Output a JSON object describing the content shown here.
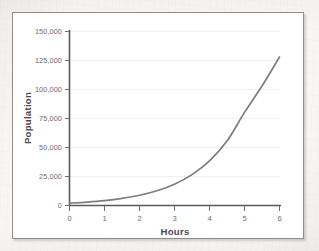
{
  "figure": {
    "background_color": "#ffffff",
    "frame_color": "#8e8e8e",
    "page_color": "#f7f6f4"
  },
  "chart_data": {
    "type": "line",
    "title": "",
    "subtitle": "",
    "xlabel": "Hours",
    "ylabel": "Population",
    "xlim": [
      0,
      6
    ],
    "ylim": [
      0,
      150000
    ],
    "grid": true,
    "grid_axis": "y",
    "legend": false,
    "legend_position": "none",
    "line_color": "#7d7d7d",
    "x_ticks": [
      0,
      1,
      2,
      3,
      4,
      5,
      6
    ],
    "x_tick_labels": [
      "0",
      "1",
      "2",
      "3",
      "4",
      "5",
      "6"
    ],
    "y_ticks": [
      0,
      25000,
      50000,
      75000,
      100000,
      125000,
      150000
    ],
    "y_tick_labels": [
      "0",
      "25,000",
      "50,000",
      "75,000",
      "100,000",
      "125,000",
      "150,000"
    ],
    "x": [
      0,
      0.25,
      0.5,
      0.75,
      1,
      1.25,
      1.5,
      1.75,
      2,
      2.25,
      2.5,
      2.75,
      3,
      3.25,
      3.5,
      3.75,
      4,
      4.25,
      4.5,
      4.75,
      5,
      5.25,
      5.5,
      5.75,
      6
    ],
    "values": [
      2000,
      2400,
      2900,
      3500,
      4200,
      5000,
      6100,
      7300,
      8800,
      10600,
      12700,
      15300,
      18400,
      22100,
      26600,
      32000,
      38400,
      46200,
      55500,
      66800,
      80300,
      96500,
      116000,
      139400,
      128000
    ],
    "series": [
      {
        "name": "Population",
        "color": "#7d7d7d",
        "points": [
          [
            0,
            2000
          ],
          [
            0.5,
            2900
          ],
          [
            1.0,
            4200
          ],
          [
            1.5,
            6100
          ],
          [
            2.0,
            8800
          ],
          [
            2.5,
            12700
          ],
          [
            3.0,
            18400
          ],
          [
            3.5,
            26600
          ],
          [
            4.0,
            38400
          ],
          [
            4.5,
            55500
          ],
          [
            5.0,
            80300
          ],
          [
            5.5,
            103000
          ],
          [
            6.0,
            128000
          ]
        ]
      }
    ],
    "endpoint": {
      "x": 6,
      "y": 128000
    }
  }
}
